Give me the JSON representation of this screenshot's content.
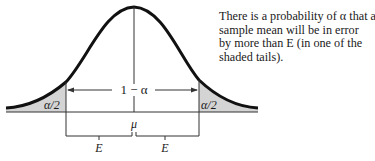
{
  "figure": {
    "labels": {
      "left_tail": "α/2",
      "right_tail": "α/2",
      "center_region": "1 − α",
      "mean": "μ",
      "left_margin": "E",
      "right_margin": "E"
    },
    "caption_lines": [
      "There is a probability of α that a",
      "sample mean will be in error",
      "by more than E (in one of the",
      "shaded tails)."
    ],
    "colors": {
      "curve": "#111111",
      "tail_fill": "#d4d4d4",
      "lines": "#333333",
      "text": "#1a1a1a"
    }
  }
}
